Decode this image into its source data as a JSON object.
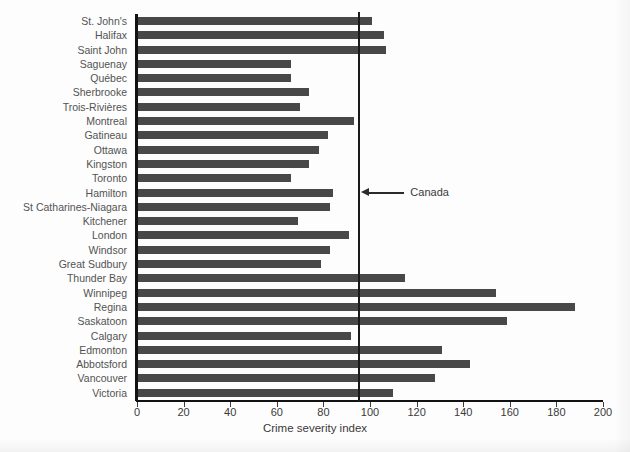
{
  "chart_data": {
    "type": "bar",
    "orientation": "horizontal",
    "title": "",
    "xlabel": "Crime severity index",
    "ylabel": "",
    "xlim": [
      0,
      200
    ],
    "xticks": [
      0,
      20,
      40,
      60,
      80,
      100,
      120,
      140,
      160,
      180,
      200
    ],
    "xtick_labels": [
      "0",
      "20",
      "40",
      "60",
      "80",
      "100",
      "120",
      "140",
      "160",
      "180",
      "200"
    ],
    "grid": false,
    "legend": null,
    "bar_color": "#484848",
    "axis_color": "#121212",
    "categories": [
      "St. John's",
      "Halifax",
      "Saint John",
      "Saguenay",
      "Québec",
      "Sherbrooke",
      "Trois-Rivières",
      "Montreal",
      "Gatineau",
      "Ottawa",
      "Kingston",
      "Toronto",
      "Hamilton",
      "St Catharines-Niagara",
      "Kitchener",
      "London",
      "Windsor",
      "Great Sudbury",
      "Thunder Bay",
      "Winnipeg",
      "Regina",
      "Saskatoon",
      "Calgary",
      "Edmonton",
      "Abbotsford",
      "Vancouver",
      "Victoria"
    ],
    "values": [
      101,
      106,
      107,
      66,
      66,
      74,
      70,
      93,
      82,
      78,
      74,
      66,
      84,
      83,
      69,
      91,
      83,
      79,
      115,
      154,
      188,
      159,
      92,
      131,
      143,
      128,
      110
    ],
    "annotations": [
      {
        "label": "Canada",
        "type": "reference-line",
        "value": 95,
        "arrow": true
      }
    ]
  }
}
